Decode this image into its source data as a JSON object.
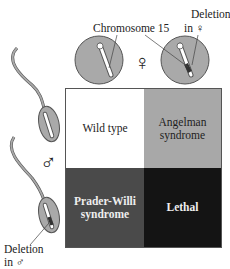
{
  "labels": {
    "chromosome": "Chromosome 15",
    "deletion_female": "Deletion\nin ♀",
    "deletion_female_line1": "Deletion",
    "deletion_female_line2": "in ♀",
    "deletion_male_line1": "Deletion",
    "deletion_male_line2": "in ♂",
    "female_symbol": "♀",
    "male_symbol": "♂"
  },
  "grid": {
    "cells": [
      {
        "label": "Wild type",
        "color": "#ffffff"
      },
      {
        "label": "Angelman syndrome",
        "line1": "Angelman",
        "line2": "syndrome",
        "color": "#a8a8a8"
      },
      {
        "label": "Prader-Willi syndrome",
        "line1": "Prader-Willi",
        "line2": "syndrome",
        "color": "#4a4a4a"
      },
      {
        "label": "Lethal",
        "color": "#141414"
      }
    ]
  },
  "colors": {
    "cell_gray": "#a9a9a9",
    "outline": "#555555"
  }
}
